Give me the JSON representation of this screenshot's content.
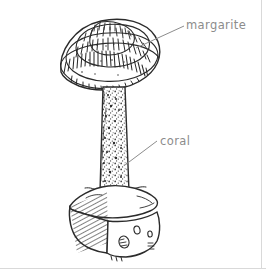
{
  "image": {
    "title": "Mushroom on rock base — ink illustration",
    "style": "pen-and-ink line drawing",
    "background_color": "#ffffff",
    "ink_color": "#2b2b2b",
    "label_color": "#8c8c8c",
    "frame_color": "#d9d9d9",
    "width": 266,
    "height": 277
  },
  "labels": [
    {
      "id": "margarite",
      "text": "margarite",
      "points_to": "cap",
      "leader_from": [
        184,
        26
      ],
      "leader_to": [
        136,
        48
      ]
    },
    {
      "id": "coral",
      "text": "coral",
      "points_to": "stem",
      "leader_from": [
        157,
        141
      ],
      "leader_to": [
        125,
        165
      ]
    }
  ],
  "subject": {
    "cap": {
      "name": "domed-cap",
      "description": "concentric banded dome with radial tick hatching"
    },
    "stem": {
      "name": "stem",
      "description": "tall tapering stipe with stippled speckled texture"
    },
    "base": {
      "name": "rock-base",
      "description": "cube-shaped rock, hatched left face, pitted front face"
    }
  },
  "frame": {
    "bottom_rule": true,
    "right_rule": true
  }
}
